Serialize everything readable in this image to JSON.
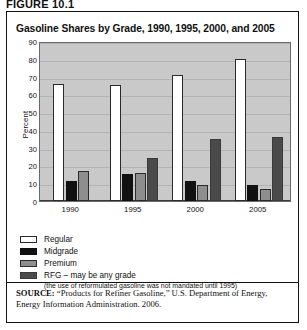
{
  "figure_label": "FIGURE 10.1",
  "chart_title": "Gasoline Shares by Grade, 1990, 1995, 2000, and 2005",
  "legend": {
    "items": [
      {
        "key": "regular",
        "label": "Regular"
      },
      {
        "key": "midgrade",
        "label": "Midgrade"
      },
      {
        "key": "premium",
        "label": "Premium"
      },
      {
        "key": "rfg",
        "label": "RFG – may be any grade"
      }
    ],
    "note": "(the use of reformulated gasoline was not mandated until 1995)"
  },
  "source": {
    "prefix": "SOURCE:",
    "text": " “Products for Refiner Gasoline,” U.S. Department of Energy, Energy Information Administration. 2006."
  },
  "colors": {
    "regular": "#ffffff",
    "midgrade": "#111111",
    "premium": "#8e8e8e",
    "rfg": "#4a4a4a",
    "plot_background": "#c9c9c9",
    "frame": "#111111"
  },
  "chart_data": {
    "type": "bar",
    "title": "Gasoline Shares by Grade, 1990, 1995, 2000, and 2005",
    "xlabel": "",
    "ylabel": "Percent",
    "ylim": [
      0,
      90
    ],
    "yticks": [
      0,
      10,
      20,
      30,
      40,
      50,
      60,
      70,
      80,
      90
    ],
    "ytick_labels": [
      "0",
      "10",
      "20",
      "30",
      "40",
      "50",
      "60",
      "70",
      "80",
      "90"
    ],
    "grid": true,
    "legend_position": "below",
    "categories": [
      "1990",
      "1995",
      "2000",
      "2005"
    ],
    "series": [
      {
        "name": "Regular",
        "key": "regular",
        "values": [
          66,
          65,
          71,
          80
        ]
      },
      {
        "name": "Midgrade",
        "key": "midgrade",
        "values": [
          11,
          15,
          11,
          9
        ]
      },
      {
        "name": "Premium",
        "key": "premium",
        "values": [
          17,
          16,
          9,
          7
        ]
      },
      {
        "name": "RFG – may be any grade",
        "key": "rfg",
        "values": [
          null,
          24,
          35,
          36
        ]
      }
    ]
  }
}
